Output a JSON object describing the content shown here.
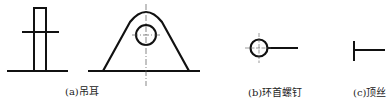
{
  "figure": {
    "panels": [
      {
        "id": "a",
        "label": "(a)吊耳",
        "description": "lifting lug – side and front views"
      },
      {
        "id": "b",
        "label": "(b)环首螺钉",
        "description": "eye bolt symbol"
      },
      {
        "id": "c",
        "label": "(c)顶丝",
        "description": "jack screw symbol"
      }
    ]
  },
  "colors": {
    "stroke": "#111111",
    "centerline": "#555555",
    "background": "#ffffff"
  }
}
